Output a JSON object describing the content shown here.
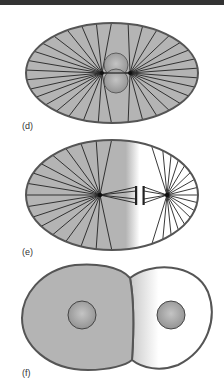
{
  "figure": {
    "colors": {
      "cytoplasm_gray": "#b4b4b4",
      "outline": "#555555",
      "spindle_line": "#222222",
      "nucleus_fill": "#a8a8a8",
      "background": "#ffffff",
      "top_bar": "#333333"
    },
    "panels": [
      {
        "id": "d",
        "label": "(d)",
        "stage": "spindle with dividing nucleus"
      },
      {
        "id": "e",
        "label": "(e)",
        "stage": "spindle poles separating, cell half shaded"
      },
      {
        "id": "f",
        "label": "(f)",
        "stage": "two daughter cells, each with nucleus"
      }
    ]
  }
}
